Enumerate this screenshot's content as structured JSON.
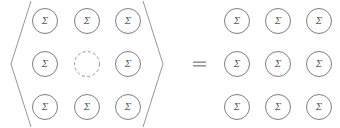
{
  "figure": {
    "kind": "mathematical-equation-diagram",
    "background_color": "#ffffff",
    "stroke_color": "#6f6f6f",
    "dashed_stroke_color": "#8d8d8d",
    "glyph_color": "#5c5c5c",
    "bracket_color": "#8a8a8a",
    "equals_color": "#8e8e8e"
  },
  "left_expression": {
    "bracket_open": "⟨",
    "bracket_close": "⟩",
    "grid": {
      "rows": 3,
      "cols": 3,
      "cells": [
        [
          {
            "label": "Σ",
            "style": "solid",
            "filled": true
          },
          {
            "label": "Σ",
            "style": "solid",
            "filled": true
          },
          {
            "label": "Σ",
            "style": "solid",
            "filled": true
          }
        ],
        [
          {
            "label": "Σ",
            "style": "solid",
            "filled": true
          },
          {
            "label": "",
            "style": "dashed",
            "filled": false
          },
          {
            "label": "Σ",
            "style": "solid",
            "filled": true
          }
        ],
        [
          {
            "label": "Σ",
            "style": "solid",
            "filled": true
          },
          {
            "label": "Σ",
            "style": "solid",
            "filled": true
          },
          {
            "label": "Σ",
            "style": "solid",
            "filled": true
          }
        ]
      ]
    }
  },
  "operator": {
    "symbol": "=",
    "name": "equals-sign"
  },
  "right_expression": {
    "bracket_open": "",
    "bracket_close": "",
    "grid": {
      "rows": 3,
      "cols": 3,
      "cells": [
        [
          {
            "label": "Σ",
            "style": "solid",
            "filled": true
          },
          {
            "label": "Σ",
            "style": "solid",
            "filled": true
          },
          {
            "label": "Σ",
            "style": "solid",
            "filled": true
          }
        ],
        [
          {
            "label": "Σ",
            "style": "solid",
            "filled": true
          },
          {
            "label": "Σ",
            "style": "solid",
            "filled": true
          },
          {
            "label": "Σ",
            "style": "solid",
            "filled": true
          }
        ],
        [
          {
            "label": "Σ",
            "style": "solid",
            "filled": true
          },
          {
            "label": "Σ",
            "style": "solid",
            "filled": true
          },
          {
            "label": "Σ",
            "style": "solid",
            "filled": true
          }
        ]
      ]
    }
  },
  "geometry": {
    "circle_radius": 12.5,
    "left_grid_x": [
      45,
      87,
      128
    ],
    "right_grid_x": [
      237,
      278,
      319
    ],
    "grid_y": [
      21,
      64,
      107
    ],
    "left_bracket": {
      "top_x": 31,
      "vertex_x": 11,
      "bottom_x": 31,
      "top_y": 1,
      "vertex_y": 64,
      "bottom_y": 127
    },
    "right_bracket": {
      "top_x": 143,
      "vertex_x": 163,
      "bottom_x": 143,
      "top_y": 1,
      "vertex_y": 64,
      "bottom_y": 127
    },
    "equals": {
      "x": 193,
      "y": 64,
      "width": 13,
      "gap": 3.6
    }
  }
}
